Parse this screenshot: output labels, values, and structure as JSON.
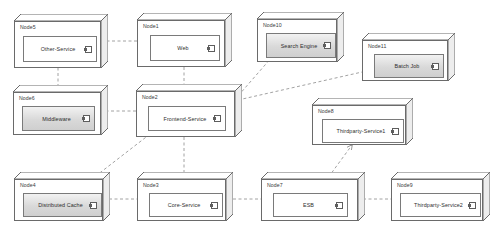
{
  "diagram": {
    "type": "uml-deployment-diagram",
    "background_color": "#ffffff",
    "node_border_color": "#6a6a6a",
    "component_border_color": "#7a7a7a",
    "edge_color": "#8a8a8a",
    "shaded_fill_color": "#d9d9d9"
  },
  "nodes": [
    {
      "id": "node5",
      "label": "Node5",
      "x": 14,
      "y": 14,
      "w": 94,
      "h": 54,
      "component": {
        "name": "Other-Service",
        "x": 8,
        "y": 14,
        "w": 74,
        "h": 26,
        "shaded": false,
        "icon": "uml-component-icon"
      }
    },
    {
      "id": "node1",
      "label": "Node1",
      "x": 137,
      "y": 13,
      "w": 95,
      "h": 54,
      "component": {
        "name": "Web",
        "x": 12,
        "y": 14,
        "w": 70,
        "h": 26,
        "shaded": false,
        "icon": "uml-component-icon"
      }
    },
    {
      "id": "node10",
      "label": "Node10",
      "x": 257,
      "y": 12,
      "w": 87,
      "h": 50,
      "component": {
        "name": "Search Engine",
        "x": 8,
        "y": 13,
        "w": 70,
        "h": 25,
        "shaded": true,
        "icon": "uml-component-icon"
      }
    },
    {
      "id": "node11",
      "label": "Node11",
      "x": 362,
      "y": 33,
      "w": 93,
      "h": 48,
      "component": {
        "name": "Batch Job",
        "x": 11,
        "y": 13,
        "w": 70,
        "h": 24,
        "shaded": true,
        "icon": "uml-component-icon"
      }
    },
    {
      "id": "node6",
      "label": "Node6",
      "x": 13,
      "y": 85,
      "w": 95,
      "h": 50,
      "component": {
        "name": "Middleware",
        "x": 8,
        "y": 13,
        "w": 73,
        "h": 25,
        "shaded": true,
        "icon": "uml-component-icon"
      }
    },
    {
      "id": "node2",
      "label": "Node2",
      "x": 136,
      "y": 84,
      "w": 106,
      "h": 53,
      "component": {
        "name": "Frontend-Service",
        "x": 11,
        "y": 14,
        "w": 78,
        "h": 25,
        "shaded": false,
        "icon": "uml-component-icon"
      }
    },
    {
      "id": "node8",
      "label": "Node8",
      "x": 312,
      "y": 98,
      "w": 101,
      "h": 47,
      "component": {
        "name": "Thirdparty-Service1",
        "x": 9,
        "y": 13,
        "w": 82,
        "h": 24,
        "shaded": false,
        "icon": "uml-component-icon"
      }
    },
    {
      "id": "node4",
      "label": "Node4",
      "x": 14,
      "y": 172,
      "w": 96,
      "h": 49,
      "component": {
        "name": "Distributed Cache",
        "x": 8,
        "y": 13,
        "w": 79,
        "h": 24,
        "shaded": true,
        "icon": "uml-component-icon"
      }
    },
    {
      "id": "node3",
      "label": "Node3",
      "x": 137,
      "y": 172,
      "w": 96,
      "h": 49,
      "component": {
        "name": "Core-Service",
        "x": 11,
        "y": 13,
        "w": 74,
        "h": 24,
        "shaded": false,
        "icon": "uml-component-icon"
      }
    },
    {
      "id": "node7",
      "label": "Node7",
      "x": 261,
      "y": 172,
      "w": 104,
      "h": 49,
      "component": {
        "name": "ESB",
        "x": 11,
        "y": 13,
        "w": 75,
        "h": 24,
        "shaded": false,
        "icon": "uml-component-icon"
      }
    },
    {
      "id": "node9",
      "label": "Node9",
      "x": 391,
      "y": 172,
      "w": 99,
      "h": 49,
      "component": {
        "name": "Thirdparty-Service2",
        "x": 8,
        "y": 13,
        "w": 81,
        "h": 24,
        "shaded": false,
        "icon": "uml-component-icon"
      }
    }
  ],
  "edges": [
    {
      "id": "e1",
      "from": "node1",
      "to": "node5",
      "points": "137,41 100,41",
      "arrow": true
    },
    {
      "id": "e2",
      "from": "node5",
      "to": "node6",
      "points": "58,62 58,97",
      "arrow": true
    },
    {
      "id": "e3",
      "from": "node1",
      "to": "node2",
      "points": "184,67 184,101",
      "arrow": true
    },
    {
      "id": "e4",
      "from": "node2",
      "to": "node6",
      "points": "136,111 100,111",
      "arrow": true
    },
    {
      "id": "e5",
      "from": "node2",
      "to": "node10",
      "points": "231,104 272,57",
      "arrow": true
    },
    {
      "id": "e6",
      "from": "node2",
      "to": "node11",
      "points": "238,100 371,70",
      "arrow": true
    },
    {
      "id": "e7",
      "from": "node2",
      "to": "node4",
      "points": "163,124 79,189",
      "arrow": true
    },
    {
      "id": "e8",
      "from": "node2",
      "to": "node3",
      "points": "184,137 184,189",
      "arrow": true
    },
    {
      "id": "e9",
      "from": "node3",
      "to": "node4",
      "points": "145,199 103,199",
      "arrow": true
    },
    {
      "id": "e10",
      "from": "node3",
      "to": "node7",
      "points": "222,199 272,199",
      "arrow": true
    },
    {
      "id": "e11",
      "from": "node7",
      "to": "node9",
      "points": "352,199 399,199",
      "arrow": true
    },
    {
      "id": "e12",
      "from": "node7",
      "to": "node8",
      "points": "322,186 352,145",
      "arrow": true
    }
  ]
}
